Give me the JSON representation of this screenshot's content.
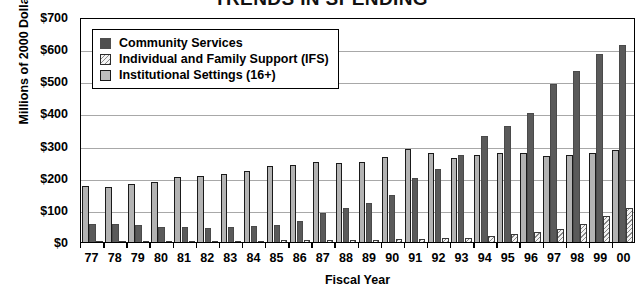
{
  "chart_data": {
    "type": "bar",
    "title": "TRENDS IN SPENDING",
    "xlabel": "Fiscal Year",
    "ylabel": "Millions of 2000 Dollars",
    "ylim": [
      0,
      700
    ],
    "ytick_step": 100,
    "ytick_labels": [
      "$700",
      "$600",
      "$500",
      "$400",
      "$300",
      "$200",
      "$100",
      "$0"
    ],
    "ytick_values": [
      700,
      600,
      500,
      400,
      300,
      200,
      100,
      0
    ],
    "grid": true,
    "legend_position": "upper-left-inside",
    "categories": [
      "77",
      "78",
      "79",
      "80",
      "81",
      "82",
      "83",
      "84",
      "85",
      "86",
      "87",
      "88",
      "89",
      "90",
      "91",
      "92",
      "93",
      "94",
      "95",
      "96",
      "97",
      "98",
      "99",
      "00"
    ],
    "series": [
      {
        "name": "Institutional Settings (16+)",
        "key": "inst",
        "color": "#b3b3b3",
        "values": [
          175,
          170,
          180,
          186,
          202,
          206,
          212,
          220,
          236,
          240,
          250,
          246,
          250,
          264,
          288,
          277,
          262,
          272,
          277,
          277,
          267,
          272,
          277,
          285
        ]
      },
      {
        "name": "Community Services",
        "key": "comm",
        "color": "#5a5a5a",
        "values": [
          57,
          55,
          52,
          48,
          46,
          45,
          48,
          50,
          52,
          65,
          90,
          106,
          120,
          147,
          200,
          228,
          270,
          330,
          362,
          400,
          492,
          533,
          585,
          612
        ]
      },
      {
        "name": "Individual and Family Support (IFS)",
        "key": "ifs",
        "color": "#f2f2f2",
        "values": [
          2,
          2,
          3,
          3,
          3,
          3,
          4,
          4,
          5,
          5,
          6,
          6,
          7,
          8,
          9,
          11,
          13,
          18,
          24,
          30,
          42,
          55,
          80,
          105
        ]
      }
    ]
  },
  "legend": {
    "items": [
      {
        "label": "Community Services",
        "swatch": "comm"
      },
      {
        "label": "Individual and Family Support (IFS)",
        "swatch": "ifs"
      },
      {
        "label": "Institutional Settings (16+)",
        "swatch": "inst"
      }
    ]
  }
}
